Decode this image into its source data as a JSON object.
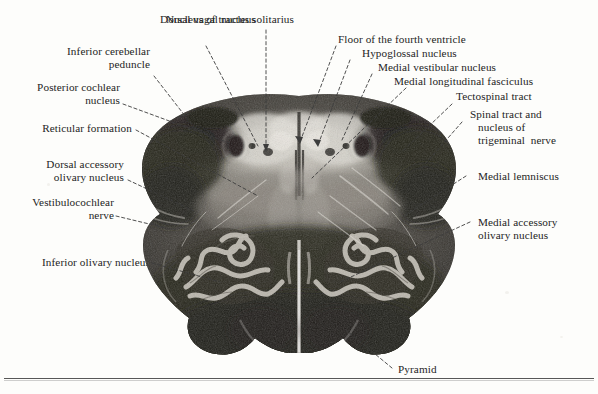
{
  "figure": {
    "rule_present": true
  },
  "labels": {
    "dorsal_vagal_nucleus": "Dorsal vagal nucleus",
    "nucleus_of_tractus_solitarius": "Nucleus of tractus solitarius",
    "inferior_cerebellar_peduncle_l1": "Inferior cerebellar",
    "inferior_cerebellar_peduncle_l2": "peduncle",
    "posterior_cochlear_nucleus_l1": "Posterior cochlear",
    "posterior_cochlear_nucleus_l2": "nucleus",
    "reticular_formation": "Reticular formation",
    "dorsal_accessory_olivary_l1": "Dorsal accessory",
    "dorsal_accessory_olivary_l2": "olivary nucleus",
    "vestibulocochlear_nerve_l1": "Vestibulocochlear",
    "vestibulocochlear_nerve_l2": "nerve",
    "inferior_olivary_nucleus": "Inferior olivary nucleus",
    "floor_of_fourth_ventricle": "Floor of the fourth ventricle",
    "hypoglossal_nucleus": "Hypoglossal nucleus",
    "medial_vestibular_nucleus": "Medial vestibular nucleus",
    "medial_longitudinal_fasciculus": "Medial longitudinal fasciculus",
    "tectospinal_tract": "Tectospinal tract",
    "spinal_trigeminal_l1": "Spinal tract and",
    "spinal_trigeminal_l2": "nucleus of",
    "spinal_trigeminal_l3": "trigeminal  nerve",
    "medial_lemniscus": "Medial lemniscus",
    "medial_accessory_olivary_l1": "Medial accessory",
    "medial_accessory_olivary_l2": "olivary nucleus",
    "pyramid": "Pyramid"
  },
  "colors": {
    "text": "#242424",
    "leader": "#3c3c3c",
    "page": "#fdfdfb",
    "tissue_dark": "#2a2724",
    "tissue_mid": "#6e6a63",
    "tissue_light": "#c9c5bc",
    "rule": "#3a3a3a"
  }
}
